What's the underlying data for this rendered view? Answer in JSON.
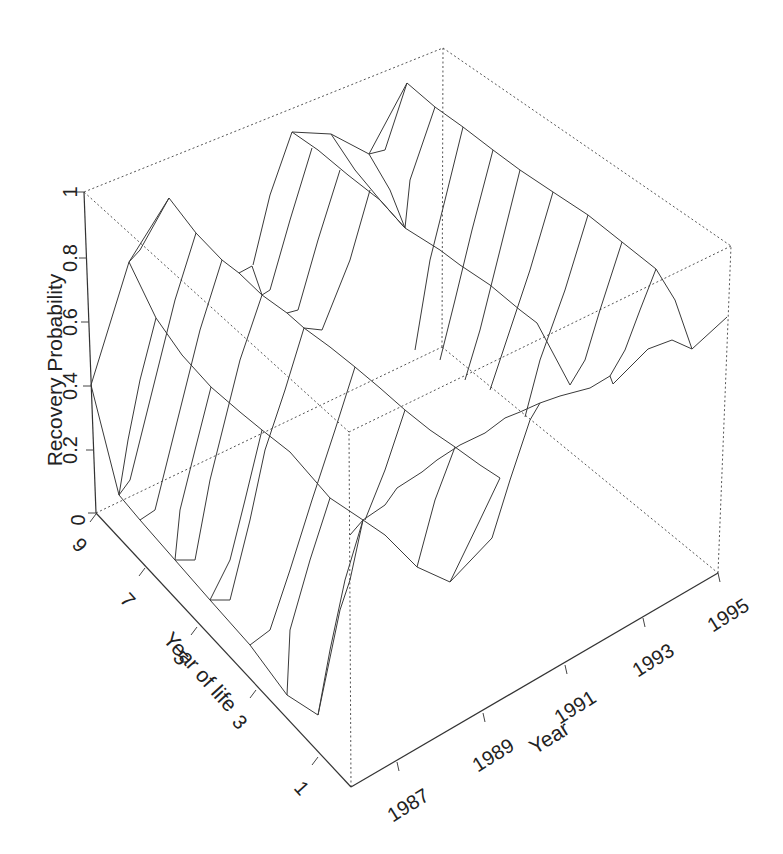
{
  "chart_data": {
    "type": "surface3d",
    "title": "",
    "xlabel": "Year",
    "ylabel": "Year of life",
    "zlabel": "Recovery Probability",
    "x_ticks": [
      "1987",
      "1989",
      "1991",
      "1993",
      "1995"
    ],
    "y_ticks": [
      "1",
      "3",
      "5",
      "7",
      "9"
    ],
    "z_ticks": [
      "0",
      "0.2",
      "0.4",
      "0.6",
      "0.8",
      "1"
    ],
    "xlim": [
      1986,
      1995
    ],
    "ylim": [
      0,
      9
    ],
    "zlim": [
      0,
      1
    ],
    "grid": false,
    "legend": null
  },
  "axes": {
    "z_title": "Recovery Probability",
    "age_title": "Year of life",
    "year_title": "Year",
    "z_ticks": [
      {
        "label": "0",
        "x": 96,
        "y": 513,
        "lx": 78,
        "ly": 520
      },
      {
        "label": "0.2",
        "x": 94,
        "y": 450,
        "lx": 70,
        "ly": 450
      },
      {
        "label": "0.4",
        "x": 91,
        "y": 386,
        "lx": 70,
        "ly": 386
      },
      {
        "label": "0.6",
        "x": 89,
        "y": 322,
        "lx": 70,
        "ly": 322
      },
      {
        "label": "0.8",
        "x": 87,
        "y": 258,
        "lx": 70,
        "ly": 258
      },
      {
        "label": "1",
        "x": 84,
        "y": 192,
        "lx": 70,
        "ly": 192
      }
    ],
    "age_ticks": [
      {
        "label": "9",
        "x": 96,
        "y": 514,
        "lx": 80,
        "ly": 545
      },
      {
        "label": "7",
        "x": 145,
        "y": 568,
        "lx": 128,
        "ly": 600
      },
      {
        "label": "5",
        "x": 197,
        "y": 627,
        "lx": 181,
        "ly": 658
      },
      {
        "label": "3",
        "x": 256,
        "y": 690,
        "lx": 240,
        "ly": 722
      },
      {
        "label": "1",
        "x": 318,
        "y": 757,
        "lx": 302,
        "ly": 788
      }
    ],
    "year_ticks": [
      {
        "label": "1987",
        "x": 397,
        "y": 762,
        "lx": 408,
        "ly": 805
      },
      {
        "label": "1989",
        "x": 483,
        "y": 713,
        "lx": 493,
        "ly": 755
      },
      {
        "label": "1991",
        "x": 565,
        "y": 665,
        "lx": 575,
        "ly": 707
      },
      {
        "label": "1993",
        "x": 643,
        "y": 618,
        "lx": 653,
        "ly": 660
      },
      {
        "label": "1995",
        "x": 718,
        "y": 573,
        "lx": 728,
        "ly": 615
      }
    ]
  },
  "box": {
    "base": {
      "front": [
        351,
        787
      ],
      "right": [
        718,
        573
      ],
      "back": [
        442,
        347
      ],
      "left": [
        96,
        513
      ]
    },
    "top": {
      "front": [
        349,
        432
      ],
      "right": [
        731,
        246
      ],
      "back": [
        443,
        48
      ],
      "left": [
        84,
        192
      ]
    }
  },
  "surface_lines": [
    [
      [
        91,
        385
      ],
      [
        129,
        262
      ],
      [
        169,
        198
      ],
      [
        196,
        233
      ],
      [
        222,
        260
      ],
      [
        239,
        273
      ],
      [
        262,
        295
      ],
      [
        287,
        313
      ],
      [
        304,
        328
      ],
      [
        330,
        347
      ],
      [
        355,
        367
      ],
      [
        380,
        388
      ],
      [
        405,
        410
      ],
      [
        430,
        430
      ],
      [
        455,
        447
      ],
      [
        480,
        465
      ],
      [
        500,
        478
      ]
    ],
    [
      [
        129,
        262
      ],
      [
        156,
        318
      ],
      [
        182,
        355
      ],
      [
        211,
        387
      ],
      [
        240,
        412
      ],
      [
        262,
        430
      ],
      [
        290,
        452
      ],
      [
        330,
        498
      ],
      [
        363,
        520
      ]
    ],
    [
      [
        91,
        385
      ],
      [
        119,
        495
      ],
      [
        140,
        520
      ],
      [
        175,
        560
      ],
      [
        210,
        600
      ],
      [
        250,
        645
      ],
      [
        287,
        695
      ],
      [
        318,
        715
      ]
    ],
    [
      [
        318,
        715
      ],
      [
        340,
        610
      ],
      [
        350,
        580
      ],
      [
        363,
        520
      ]
    ],
    [
      [
        350,
        535
      ],
      [
        363,
        520
      ],
      [
        385,
        505
      ],
      [
        397,
        488
      ],
      [
        422,
        472
      ],
      [
        437,
        460
      ],
      [
        460,
        445
      ],
      [
        485,
        433
      ],
      [
        505,
        418
      ],
      [
        520,
        412
      ],
      [
        540,
        403
      ],
      [
        560,
        396
      ],
      [
        590,
        388
      ],
      [
        610,
        376
      ],
      [
        613,
        384
      ],
      [
        648,
        349
      ],
      [
        672,
        340
      ],
      [
        692,
        349
      ],
      [
        727,
        317
      ]
    ],
    [
      [
        363,
        520
      ],
      [
        385,
        535
      ],
      [
        417,
        567
      ],
      [
        450,
        582
      ],
      [
        492,
        538
      ],
      [
        510,
        480
      ],
      [
        530,
        420
      ],
      [
        540,
        403
      ]
    ],
    [
      [
        292,
        132
      ],
      [
        331,
        134
      ],
      [
        369,
        154
      ],
      [
        407,
        83
      ],
      [
        435,
        107
      ],
      [
        463,
        127
      ],
      [
        493,
        150
      ],
      [
        520,
        170
      ],
      [
        553,
        192
      ],
      [
        588,
        215
      ],
      [
        622,
        242
      ],
      [
        656,
        269
      ],
      [
        675,
        300
      ],
      [
        692,
        349
      ]
    ],
    [
      [
        292,
        132
      ],
      [
        318,
        150
      ],
      [
        348,
        175
      ],
      [
        380,
        200
      ],
      [
        405,
        228
      ],
      [
        440,
        250
      ],
      [
        460,
        265
      ],
      [
        490,
        285
      ],
      [
        520,
        310
      ],
      [
        537,
        323
      ],
      [
        570,
        385
      ]
    ],
    [
      [
        331,
        134
      ],
      [
        355,
        170
      ],
      [
        380,
        200
      ],
      [
        405,
        228
      ]
    ],
    [
      [
        369,
        154
      ],
      [
        390,
        190
      ],
      [
        405,
        228
      ]
    ],
    [
      [
        252,
        266
      ],
      [
        262,
        295
      ]
    ],
    [
      [
        239,
        273
      ],
      [
        252,
        266
      ]
    ],
    [
      [
        169,
        198
      ],
      [
        140,
        250
      ],
      [
        129,
        262
      ]
    ],
    [
      [
        292,
        132
      ],
      [
        270,
        195
      ],
      [
        253,
        265
      ]
    ],
    [
      [
        312,
        148
      ],
      [
        290,
        220
      ],
      [
        270,
        290
      ],
      [
        262,
        295
      ]
    ],
    [
      [
        340,
        170
      ],
      [
        318,
        240
      ],
      [
        298,
        310
      ],
      [
        287,
        313
      ]
    ],
    [
      [
        370,
        190
      ],
      [
        350,
        260
      ],
      [
        322,
        330
      ],
      [
        304,
        328
      ]
    ],
    [
      [
        407,
        83
      ],
      [
        385,
        150
      ],
      [
        369,
        154
      ]
    ],
    [
      [
        435,
        107
      ],
      [
        410,
        180
      ],
      [
        405,
        228
      ]
    ],
    [
      [
        463,
        127
      ],
      [
        445,
        200
      ],
      [
        430,
        260
      ],
      [
        420,
        320
      ],
      [
        415,
        350
      ]
    ],
    [
      [
        493,
        150
      ],
      [
        472,
        230
      ],
      [
        455,
        300
      ],
      [
        440,
        360
      ]
    ],
    [
      [
        520,
        170
      ],
      [
        500,
        250
      ],
      [
        480,
        330
      ],
      [
        465,
        380
      ]
    ],
    [
      [
        553,
        192
      ],
      [
        530,
        270
      ],
      [
        510,
        330
      ],
      [
        490,
        390
      ]
    ],
    [
      [
        588,
        215
      ],
      [
        565,
        290
      ],
      [
        540,
        360
      ],
      [
        525,
        417
      ]
    ],
    [
      [
        622,
        242
      ],
      [
        600,
        310
      ],
      [
        585,
        360
      ],
      [
        570,
        385
      ]
    ],
    [
      [
        656,
        269
      ],
      [
        640,
        310
      ],
      [
        625,
        350
      ],
      [
        610,
        376
      ]
    ],
    [
      [
        196,
        233
      ],
      [
        175,
        300
      ],
      [
        160,
        360
      ],
      [
        145,
        420
      ],
      [
        130,
        480
      ],
      [
        119,
        495
      ]
    ],
    [
      [
        222,
        260
      ],
      [
        200,
        330
      ],
      [
        185,
        390
      ],
      [
        170,
        450
      ],
      [
        155,
        510
      ],
      [
        140,
        520
      ]
    ],
    [
      [
        262,
        295
      ],
      [
        240,
        360
      ],
      [
        225,
        420
      ],
      [
        210,
        480
      ],
      [
        195,
        560
      ],
      [
        175,
        560
      ]
    ],
    [
      [
        304,
        328
      ],
      [
        285,
        390
      ],
      [
        265,
        450
      ],
      [
        250,
        520
      ],
      [
        230,
        600
      ],
      [
        210,
        600
      ]
    ],
    [
      [
        355,
        367
      ],
      [
        335,
        430
      ],
      [
        312,
        500
      ],
      [
        290,
        570
      ],
      [
        270,
        630
      ],
      [
        250,
        645
      ]
    ],
    [
      [
        405,
        410
      ],
      [
        385,
        470
      ],
      [
        365,
        520
      ]
    ],
    [
      [
        455,
        447
      ],
      [
        435,
        500
      ],
      [
        417,
        567
      ]
    ],
    [
      [
        500,
        478
      ],
      [
        480,
        520
      ],
      [
        450,
        582
      ]
    ],
    [
      [
        156,
        318
      ],
      [
        140,
        380
      ],
      [
        128,
        440
      ],
      [
        119,
        495
      ]
    ],
    [
      [
        211,
        387
      ],
      [
        195,
        450
      ],
      [
        180,
        510
      ],
      [
        175,
        560
      ]
    ],
    [
      [
        262,
        430
      ],
      [
        245,
        500
      ],
      [
        230,
        560
      ],
      [
        210,
        600
      ]
    ],
    [
      [
        330,
        498
      ],
      [
        310,
        560
      ],
      [
        290,
        630
      ],
      [
        287,
        695
      ]
    ],
    [
      [
        363,
        520
      ],
      [
        345,
        580
      ],
      [
        330,
        650
      ],
      [
        318,
        715
      ]
    ]
  ]
}
